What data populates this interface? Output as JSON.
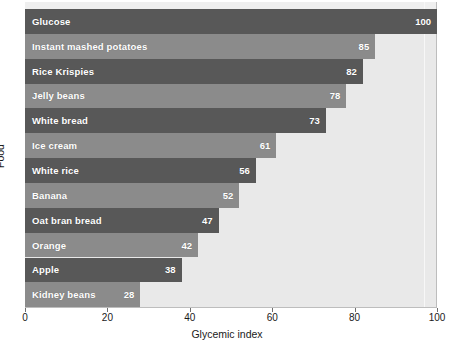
{
  "chart_data": {
    "type": "bar",
    "orientation": "horizontal",
    "title": "",
    "xlabel": "Glycemic index",
    "ylabel": "Food",
    "xlim": [
      0,
      100
    ],
    "xticks": [
      0,
      20,
      40,
      60,
      80,
      100
    ],
    "xtick_labels": [
      "0",
      "20",
      "40",
      "60",
      "80",
      "100"
    ],
    "grid": false,
    "legend": null,
    "categories": [
      "Glucose",
      "Instant mashed potatoes",
      "Rice Krispies",
      "Jelly beans",
      "White bread",
      "Ice cream",
      "White rice",
      "Banana",
      "Oat bran bread",
      "Orange",
      "Apple",
      "Kidney beans"
    ],
    "values": [
      100,
      85,
      82,
      78,
      73,
      61,
      56,
      52,
      47,
      42,
      38,
      28
    ],
    "value_labels": [
      "100",
      "85",
      "82",
      "78",
      "73",
      "61",
      "56",
      "52",
      "47",
      "42",
      "38",
      "28"
    ],
    "bar_colors": [
      "#585858",
      "#8b8b8b",
      "#585858",
      "#8b8b8b",
      "#585858",
      "#8b8b8b",
      "#585858",
      "#8b8b8b",
      "#585858",
      "#8b8b8b",
      "#585858",
      "#8b8b8b"
    ],
    "bars": [
      {
        "category": "Glucose",
        "value": 100,
        "label": "100",
        "shade": "dark"
      },
      {
        "category": "Instant mashed potatoes",
        "value": 85,
        "label": "85",
        "shade": "light"
      },
      {
        "category": "Rice Krispies",
        "value": 82,
        "label": "82",
        "shade": "dark"
      },
      {
        "category": "Jelly beans",
        "value": 78,
        "label": "78",
        "shade": "light"
      },
      {
        "category": "White bread",
        "value": 73,
        "label": "73",
        "shade": "dark"
      },
      {
        "category": "Ice cream",
        "value": 61,
        "label": "61",
        "shade": "light"
      },
      {
        "category": "White rice",
        "value": 56,
        "label": "56",
        "shade": "dark"
      },
      {
        "category": "Banana",
        "value": 52,
        "label": "52",
        "shade": "light"
      },
      {
        "category": "Oat bran bread",
        "value": 47,
        "label": "47",
        "shade": "dark"
      },
      {
        "category": "Orange",
        "value": 42,
        "label": "42",
        "shade": "light"
      },
      {
        "category": "Apple",
        "value": 38,
        "label": "38",
        "shade": "dark"
      },
      {
        "category": "Kidney beans",
        "value": 28,
        "label": "28",
        "shade": "light"
      }
    ],
    "plot_background_color": "#e9e9e9",
    "label_text_color": "#ffffff"
  }
}
